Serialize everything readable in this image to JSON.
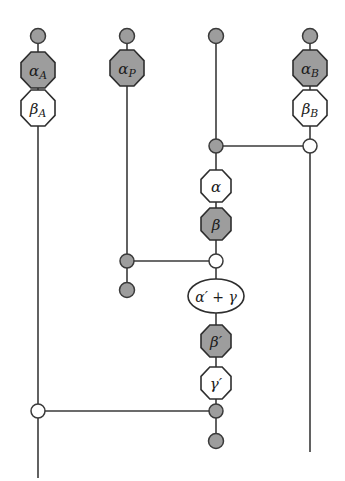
{
  "figure": {
    "kind": "quantum-circuit-diagram",
    "width": 345,
    "height": 481,
    "background_color": "#ffffff",
    "wire_color": "#3a3a3a",
    "node_fill_color": "#9d9d9d",
    "node_open_color": "#ffffff",
    "gate_gray_color": "#9d9d9d",
    "gate_white_color": "#ffffff",
    "gate_outline_color": "#2e2e2e"
  },
  "wires": [
    {
      "id": "wire-1",
      "x": 38,
      "y_top": 36,
      "y_bottom": 478
    },
    {
      "id": "wire-2",
      "x": 127,
      "y_top": 36,
      "y_bottom": 290
    },
    {
      "id": "wire-3",
      "x": 216,
      "y_top": 36,
      "y_bottom": 440
    },
    {
      "id": "wire-4",
      "x": 310,
      "y_top": 36,
      "y_bottom": 452
    }
  ],
  "nodes": [
    {
      "id": "node-w1-top",
      "name": "terminal-dot-wire1-top",
      "x": 38,
      "y": 36,
      "r": 7.5,
      "style": "filled"
    },
    {
      "id": "node-w2-top",
      "name": "terminal-dot-wire2-top",
      "x": 127,
      "y": 36,
      "r": 7.5,
      "style": "filled"
    },
    {
      "id": "node-w3-top",
      "name": "terminal-dot-wire3-top",
      "x": 216,
      "y": 36,
      "r": 7.5,
      "style": "filled"
    },
    {
      "id": "node-w4-top",
      "name": "terminal-dot-wire4-top",
      "x": 310,
      "y": 36,
      "r": 7.5,
      "style": "filled"
    },
    {
      "id": "node-w3-ctrl-a",
      "name": "control-dot-wire3-upper",
      "x": 216,
      "y": 146,
      "r": 7.0,
      "style": "filled"
    },
    {
      "id": "node-w4-targ-a",
      "name": "target-circle-wire4",
      "x": 310,
      "y": 146,
      "r": 7.0,
      "style": "open"
    },
    {
      "id": "node-w2-ctrl",
      "name": "control-dot-wire2",
      "x": 127,
      "y": 261,
      "r": 7.0,
      "style": "filled"
    },
    {
      "id": "node-w3-targ",
      "name": "target-circle-wire3-mid",
      "x": 216,
      "y": 261,
      "r": 7.0,
      "style": "open"
    },
    {
      "id": "node-w2-end",
      "name": "terminal-dot-wire2-bottom",
      "x": 127,
      "y": 290,
      "r": 7.5,
      "style": "filled"
    },
    {
      "id": "node-w1-targ",
      "name": "target-circle-wire1",
      "x": 38,
      "y": 411,
      "r": 7.0,
      "style": "open"
    },
    {
      "id": "node-w3-ctrl-b",
      "name": "control-dot-wire3-lower",
      "x": 216,
      "y": 411,
      "r": 7.0,
      "style": "filled"
    },
    {
      "id": "node-w3-end",
      "name": "terminal-dot-wire3-bottom",
      "x": 216,
      "y": 441,
      "r": 7.5,
      "style": "filled"
    }
  ],
  "links": [
    {
      "id": "link-upper",
      "name": "link-wire3-wire4",
      "x1": 216,
      "x2": 310,
      "y": 146
    },
    {
      "id": "link-middle",
      "name": "link-wire2-wire3",
      "x1": 127,
      "x2": 216,
      "y": 261
    },
    {
      "id": "link-lower",
      "name": "link-wire1-wire3",
      "x1": 38,
      "x2": 216,
      "y": 411
    }
  ],
  "gates": [
    {
      "id": "gate-alpha-A",
      "name": "gate-alpha-a",
      "symbol": "α",
      "subscript": "A",
      "label": "α_A",
      "x": 38,
      "y": 70,
      "rx": 17,
      "ry": 18,
      "shape": "octagon",
      "fill": "gray",
      "font_size": 15
    },
    {
      "id": "gate-beta-A",
      "name": "gate-beta-a",
      "symbol": "β",
      "subscript": "A",
      "label": "β_A",
      "x": 38,
      "y": 108,
      "rx": 17,
      "ry": 18,
      "shape": "octagon",
      "fill": "white",
      "font_size": 15
    },
    {
      "id": "gate-alpha-P",
      "name": "gate-alpha-p",
      "symbol": "α",
      "subscript": "P",
      "label": "α_P",
      "x": 127,
      "y": 68,
      "rx": 17,
      "ry": 18,
      "shape": "octagon",
      "fill": "gray",
      "font_size": 15
    },
    {
      "id": "gate-alpha-B",
      "name": "gate-alpha-b",
      "symbol": "α",
      "subscript": "B",
      "label": "α_B",
      "x": 310,
      "y": 68,
      "rx": 17,
      "ry": 18,
      "shape": "octagon",
      "fill": "gray",
      "font_size": 15
    },
    {
      "id": "gate-beta-B",
      "name": "gate-beta-b",
      "symbol": "β",
      "subscript": "B",
      "label": "β_B",
      "x": 310,
      "y": 108,
      "rx": 17,
      "ry": 18,
      "shape": "octagon",
      "fill": "white",
      "font_size": 15
    },
    {
      "id": "gate-alpha",
      "name": "gate-alpha",
      "symbol": "α",
      "subscript": "",
      "label": "α",
      "x": 216,
      "y": 186,
      "rx": 15,
      "ry": 16,
      "shape": "octagon",
      "fill": "white",
      "font_size": 15
    },
    {
      "id": "gate-beta",
      "name": "gate-beta",
      "symbol": "β",
      "subscript": "",
      "label": "β",
      "x": 216,
      "y": 224,
      "rx": 15,
      "ry": 16,
      "shape": "octagon",
      "fill": "gray",
      "font_size": 15
    },
    {
      "id": "gate-alpha-prime-plus-gamma",
      "name": "gate-alpha-prime-plus-gamma",
      "symbol": "α′ + γ",
      "subscript": "",
      "label": "α′ + γ",
      "x": 216,
      "y": 296,
      "rx": 28,
      "ry": 17,
      "shape": "ellipse",
      "fill": "white",
      "font_size": 14
    },
    {
      "id": "gate-beta-prime",
      "name": "gate-beta-prime",
      "symbol": "β′",
      "subscript": "",
      "label": "β′",
      "x": 216,
      "y": 341,
      "rx": 15,
      "ry": 16,
      "shape": "octagon",
      "fill": "gray",
      "font_size": 15
    },
    {
      "id": "gate-gamma-prime",
      "name": "gate-gamma-prime",
      "symbol": "γ′",
      "subscript": "",
      "label": "γ′",
      "x": 216,
      "y": 383,
      "rx": 15,
      "ry": 16,
      "shape": "octagon",
      "fill": "white",
      "font_size": 15
    }
  ]
}
